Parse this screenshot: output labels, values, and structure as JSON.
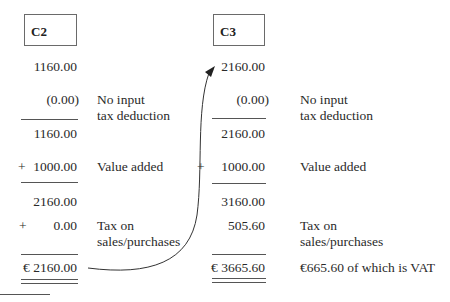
{
  "columns": [
    {
      "heading": "C2",
      "rows": {
        "start": "1160.00",
        "deduction": "(0.00)",
        "subtotal1": "1160.00",
        "value_added_sign": "+",
        "value_added": "1000.00",
        "subtotal2": "2160.00",
        "tax_sign": "+",
        "tax": "0.00",
        "total": "€ 2160.00"
      },
      "labels": {
        "deduction_line1": "No input",
        "deduction_line2": "tax deduction",
        "value_added": "Value added",
        "tax_line1": "Tax on",
        "tax_line2": "sales/purchases"
      }
    },
    {
      "heading": "C3",
      "rows": {
        "start": "2160.00",
        "deduction": "(0.00)",
        "subtotal1": "2160.00",
        "value_added_sign": "+",
        "value_added": "1000.00",
        "subtotal2": "3160.00",
        "tax": "505.60",
        "total": "€ 3665.60"
      },
      "labels": {
        "deduction_line1": "No input",
        "deduction_line2": "tax deduction",
        "value_added": "Value added",
        "tax_line1": "Tax on",
        "tax_line2": "sales/purchases",
        "total_note": "€665.60 of which is VAT"
      }
    }
  ],
  "arrow": {
    "from": "C2 total",
    "to": "C3 start"
  }
}
